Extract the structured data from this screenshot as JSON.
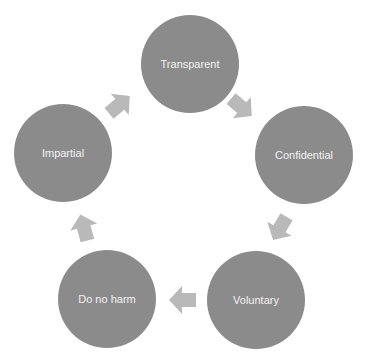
{
  "diagram": {
    "type": "cycle",
    "colors": {
      "node_fill": "#8b8b8b",
      "arrow_fill": "#b9b9b9",
      "label_color": "#f2f2f2",
      "background": "#ffffff"
    },
    "nodes": [
      {
        "id": "transparent",
        "label": "Transparent"
      },
      {
        "id": "confidential",
        "label": "Confidential"
      },
      {
        "id": "voluntary",
        "label": "Voluntary"
      },
      {
        "id": "do-no-harm",
        "label": "Do no harm"
      },
      {
        "id": "impartial",
        "label": "Impartial"
      }
    ],
    "edges": [
      {
        "from": "Transparent",
        "to": "Confidential"
      },
      {
        "from": "Confidential",
        "to": "Voluntary"
      },
      {
        "from": "Voluntary",
        "to": "Do no harm"
      },
      {
        "from": "Do no harm",
        "to": "Impartial"
      },
      {
        "from": "Impartial",
        "to": "Transparent"
      }
    ]
  }
}
